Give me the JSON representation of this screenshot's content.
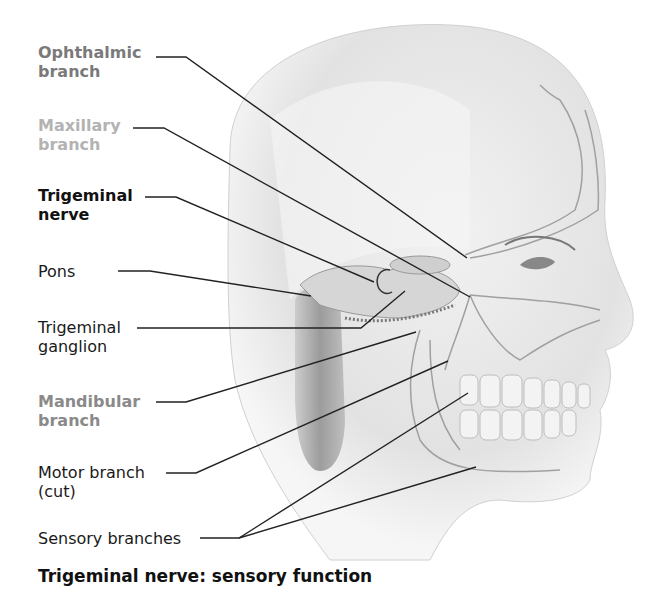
{
  "figure": {
    "title": "Trigeminal nerve: sensory function",
    "colors": {
      "ophthalmic": "#7a7a7a",
      "maxillary": "#b3b3b3",
      "trigeminal": "#111111",
      "mandibular": "#8a8a8a",
      "normal": "#1a1a1a",
      "leader_line": "#222222",
      "skin": "#e6e6e6",
      "nerve": "#9a9a9a"
    }
  },
  "labels": [
    {
      "id": "ophthalmic",
      "line1": "Ophthalmic",
      "line2": "branch",
      "bold": true
    },
    {
      "id": "maxillary",
      "line1": "Maxillary",
      "line2": "branch",
      "bold": true
    },
    {
      "id": "trigeminal-nerve",
      "line1": "Trigeminal",
      "line2": "nerve",
      "bold": true
    },
    {
      "id": "pons",
      "line1": "Pons",
      "line2": "",
      "bold": false
    },
    {
      "id": "trigeminal-ganglion",
      "line1": "Trigeminal",
      "line2": "ganglion",
      "bold": false
    },
    {
      "id": "mandibular",
      "line1": "Mandibular",
      "line2": "branch",
      "bold": true
    },
    {
      "id": "motor-branch",
      "line1": "Motor branch",
      "line2": "(cut)",
      "bold": false
    },
    {
      "id": "sensory-branches",
      "line1": "Sensory branches",
      "line2": "",
      "bold": false
    }
  ]
}
